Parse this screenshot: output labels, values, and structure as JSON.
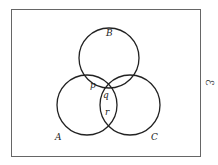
{
  "diagram": {
    "type": "venn",
    "universal_set_symbol": "ℰ",
    "sets": [
      {
        "name": "A",
        "label": "A"
      },
      {
        "name": "B",
        "label": "B"
      },
      {
        "name": "C",
        "label": "C"
      }
    ],
    "regions": [
      {
        "label": "p",
        "description": "A ∩ B only"
      },
      {
        "label": "q",
        "description": "A ∩ B ∩ C"
      },
      {
        "label": "r",
        "description": "A ∩ C only"
      }
    ],
    "colors": {
      "stroke": "#222222",
      "frame": "#555555",
      "background": "#ffffff"
    }
  }
}
